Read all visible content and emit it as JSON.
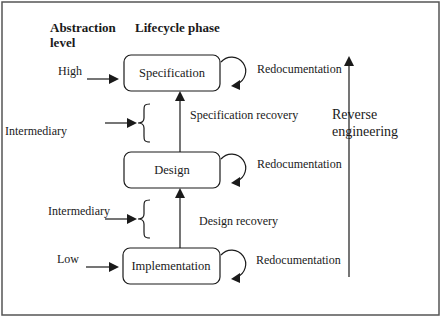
{
  "headers": {
    "abstraction_level_line1": "Abstraction",
    "abstraction_level_line2": "level",
    "lifecycle_phase": "Lifecycle phase"
  },
  "levels": {
    "high": "High",
    "intermediary_upper": "Intermediary",
    "intermediary_lower": "Intermediary",
    "low": "Low"
  },
  "phases": {
    "specification": "Specification",
    "design": "Design",
    "implementation": "Implementation"
  },
  "self_loops": {
    "specification": "Redocumentation",
    "design": "Redocumentation",
    "implementation": "Redocumentation"
  },
  "transitions": {
    "design_to_specification": "Specification recovery",
    "implementation_to_design": "Design recovery"
  },
  "reverse_engineering": {
    "line1": "Reverse",
    "line2": "engineering"
  },
  "colors": {
    "ink": "#1a1a1a",
    "frame": "#555555",
    "background": "#ffffff"
  }
}
